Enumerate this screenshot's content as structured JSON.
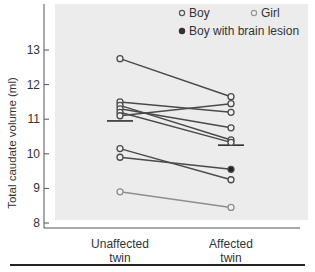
{
  "chart_data": {
    "type": "line",
    "title": "",
    "xlabel": "",
    "ylabel": "Total caudate volume (ml)",
    "ylim": [
      7.9,
      14.4
    ],
    "yticks": [
      8,
      9,
      10,
      11,
      12,
      13
    ],
    "categories": [
      [
        "Unaffected",
        "twin"
      ],
      [
        "Affected",
        "twin"
      ]
    ],
    "legend": [
      {
        "label": "Boy",
        "marker": "open-circle",
        "color": "#555555"
      },
      {
        "label": "Girl",
        "marker": "open-circle",
        "color": "#999999"
      },
      {
        "label": "Boy with brain lesion",
        "marker": "filled-circle",
        "color": "#333333"
      }
    ],
    "legend_position": "top-right",
    "grid": false,
    "series": [
      {
        "name": "Boy",
        "values": [
          12.75,
          11.65
        ],
        "lesion": false
      },
      {
        "name": "Boy",
        "values": [
          11.5,
          11.2
        ],
        "lesion": false
      },
      {
        "name": "Boy",
        "values": [
          11.4,
          10.4
        ],
        "lesion": false
      },
      {
        "name": "Boy",
        "values": [
          11.3,
          10.75
        ],
        "lesion": false
      },
      {
        "name": "Boy",
        "values": [
          11.2,
          10.33
        ],
        "lesion": false
      },
      {
        "name": "Boy",
        "values": [
          11.1,
          11.45
        ],
        "lesion": false
      },
      {
        "name": "Boy",
        "values": [
          10.15,
          9.25
        ],
        "lesion": false
      },
      {
        "name": "Boy with brain lesion",
        "values": [
          9.9,
          9.55
        ],
        "lesion": true
      },
      {
        "name": "Girl",
        "values": [
          8.9,
          8.45
        ],
        "lesion": false
      }
    ],
    "means": [
      10.95,
      10.25
    ]
  },
  "colors": {
    "plot_bg": "#ececec",
    "boy": "#4a4a4a",
    "girl": "#8e8e8e",
    "axis": "#555555"
  }
}
